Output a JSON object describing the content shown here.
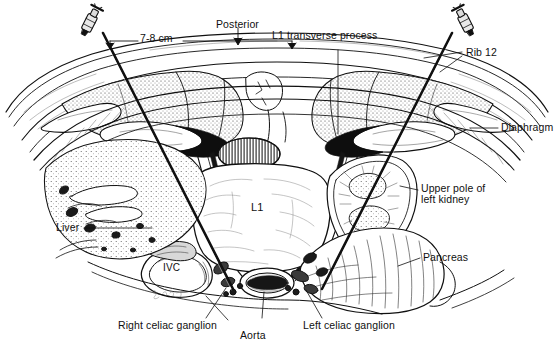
{
  "figure": {
    "view_orientation": "axial cross-section, posterior at top",
    "background_color": "#ffffff",
    "ink_color": "#101010"
  },
  "measurement": {
    "label": "7-8 cm",
    "description": "distance between left and right needle skin entry points lateral to midline"
  },
  "labels": {
    "posterior": "Posterior",
    "l1_transverse_process": "L1 transverse process",
    "rib_12": "Rib 12",
    "diaphragm": "Diaphragm",
    "upper_pole_left_kidney": "Upper pole of\nleft kidney",
    "upper_pole_left_kidney_line1": "Upper pole of",
    "upper_pole_left_kidney_line2": "left kidney",
    "pancreas": "Pancreas",
    "left_celiac_ganglion": "Left celiac ganglion",
    "aorta": "Aorta",
    "right_celiac_ganglion": "Right celiac ganglion",
    "liver": "Liver",
    "ivc": "IVC",
    "l1_vertebral_body": "L1"
  },
  "structures": [
    {
      "name": "skin-and-subcutaneous-layer",
      "side": "both"
    },
    {
      "name": "paraspinal-muscle-mass",
      "side": "both"
    },
    {
      "name": "l1-vertebral-body",
      "side": "midline"
    },
    {
      "name": "spinal-canal",
      "side": "midline"
    },
    {
      "name": "l1-transverse-process",
      "side": "both"
    },
    {
      "name": "rib-12",
      "side": "both"
    },
    {
      "name": "diaphragm",
      "side": "both"
    },
    {
      "name": "liver",
      "side": "right"
    },
    {
      "name": "inferior-vena-cava",
      "side": "right"
    },
    {
      "name": "aorta",
      "side": "midline"
    },
    {
      "name": "upper-pole-left-kidney",
      "side": "left"
    },
    {
      "name": "pancreas",
      "side": "left"
    },
    {
      "name": "right-celiac-ganglion",
      "side": "right"
    },
    {
      "name": "left-celiac-ganglion",
      "side": "left"
    }
  ],
  "needles": [
    {
      "name": "left-needle",
      "entry_side": "patient-right-image-left",
      "hub": "luer-lock-hub"
    },
    {
      "name": "right-needle",
      "entry_side": "patient-left-image-right",
      "hub": "luer-lock-hub"
    }
  ]
}
